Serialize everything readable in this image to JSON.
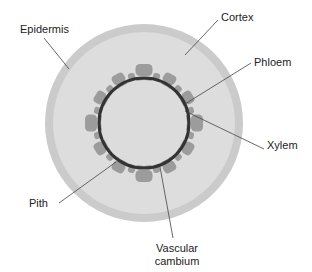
{
  "diagram": {
    "colors": {
      "epidermis": "#cbcbcb",
      "cortex": "#dddddd",
      "pith": "#dcdcdc",
      "bundle_outer": "#9c9c9c",
      "bundle_inner": "#8e8e8e",
      "cambium": "#333333",
      "leader": "#444444",
      "text": "#222222"
    },
    "labels": {
      "epidermis": "Epidermis",
      "cortex": "Cortex",
      "phloem": "Phloem",
      "xylem": "Xylem",
      "pith": "Pith",
      "cambium_line1": "Vascular",
      "cambium_line2": "cambium"
    },
    "geometry": {
      "center": [
        144,
        123
      ],
      "outer_radius": 99,
      "epidermis_width": 8,
      "cambium_radius": 45,
      "bundle_count": 12
    }
  }
}
